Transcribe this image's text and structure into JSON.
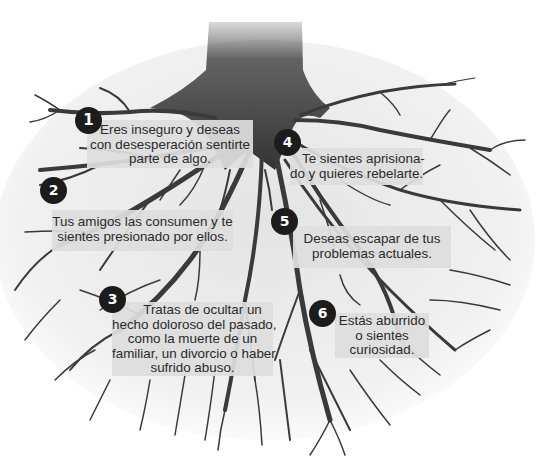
{
  "diagram": {
    "colors": {
      "background": "#ffffff",
      "roots": "#3a3a3a",
      "badge_fill": "#1c1c1c",
      "badge_text": "#ffffff",
      "box_fill": "#dedede",
      "text": "#2a2a2a"
    },
    "callouts": [
      {
        "number": "1",
        "lines": [
          "Eres inseguro y deseas",
          "con desesperación sentirte",
          "parte de algo."
        ]
      },
      {
        "number": "2",
        "lines": [
          "Tus amigos las consumen y te",
          "sientes presionado por ellos."
        ]
      },
      {
        "number": "3",
        "lines": [
          "Tratas de ocultar un",
          "hecho doloroso del pasado,",
          "como la muerte de un",
          "familiar, un divorcio o haber",
          "sufrido abuso."
        ]
      },
      {
        "number": "4",
        "lines": [
          "Te sientes aprisiona-",
          "do y quieres rebelarte."
        ]
      },
      {
        "number": "5",
        "lines": [
          "Deseas escapar de tus",
          "problemas actuales."
        ]
      },
      {
        "number": "6",
        "lines": [
          "Estás aburrido",
          "o sientes",
          "curiosidad."
        ]
      }
    ]
  }
}
